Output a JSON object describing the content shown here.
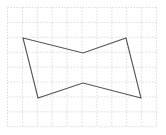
{
  "diagram": {
    "type": "grid-polygon",
    "grid": {
      "x0": 7.5,
      "y0": 7.5,
      "cell": 14.9,
      "cols": 10,
      "rows": 8,
      "color": "#d4d4d4",
      "dash": "1.5,1.5"
    },
    "polygon": {
      "points": [
        [
          23,
          38
        ],
        [
          83,
          53
        ],
        [
          126,
          38
        ],
        [
          141,
          98
        ],
        [
          83,
          83
        ],
        [
          38,
          98
        ]
      ],
      "stroke": "#555555",
      "stroke_width": 1.1,
      "fill": "none"
    }
  }
}
